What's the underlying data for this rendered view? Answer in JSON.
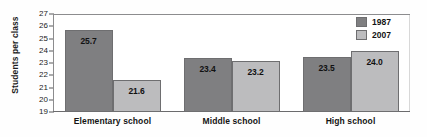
{
  "chart_data": {
    "type": "bar",
    "title": "",
    "subtitle": "",
    "xlabel": "",
    "ylabel": "Students per class",
    "ylim": [
      19,
      27
    ],
    "ytick_step": 1,
    "yticks": [
      "27",
      "26",
      "25",
      "24",
      "23",
      "22",
      "21",
      "20",
      "19"
    ],
    "grid": false,
    "legend_position": "top-right",
    "categories": [
      "Elementary school",
      "Middle school",
      "High school"
    ],
    "series": [
      {
        "name": "1987",
        "color": "#7f7f81",
        "values": [
          25.7,
          23.4,
          23.5
        ],
        "labels": [
          "25.7",
          "23.4",
          "23.5"
        ]
      },
      {
        "name": "2007",
        "color": "#bcbcbe",
        "values": [
          21.6,
          23.2,
          24.0
        ],
        "labels": [
          "21.6",
          "23.2",
          "24.0"
        ]
      }
    ]
  },
  "colors": {
    "series_1987": "#7f7f81",
    "series_2007": "#bcbcbe",
    "frame": "#8c8c8e",
    "text": "#141414",
    "background": "#ffffff"
  }
}
